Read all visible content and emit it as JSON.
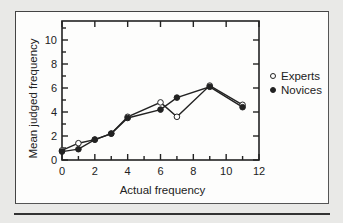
{
  "chart_data": {
    "type": "line",
    "title": "",
    "xlabel": "Actual frequency",
    "ylabel": "Mean judged frequency",
    "xlim": [
      0,
      12
    ],
    "ylim": [
      0,
      11
    ],
    "xticks": [
      0,
      2,
      4,
      6,
      8,
      10,
      12
    ],
    "yticks": [
      0,
      2,
      4,
      6,
      8,
      10
    ],
    "grid": false,
    "legend_position": "right",
    "series": [
      {
        "name": "Experts",
        "marker": "open-circle",
        "x": [
          0,
          1,
          2,
          3,
          4,
          6,
          7,
          9,
          11
        ],
        "y": [
          0.8,
          1.4,
          1.7,
          2.2,
          3.6,
          4.8,
          3.6,
          6.2,
          4.6
        ]
      },
      {
        "name": "Novices",
        "marker": "filled-circle",
        "x": [
          0,
          1,
          2,
          3,
          4,
          6,
          7,
          9,
          11
        ],
        "y": [
          0.7,
          0.9,
          1.7,
          2.2,
          3.5,
          4.2,
          5.2,
          6.1,
          4.4
        ]
      }
    ]
  },
  "colors": {
    "background": "#e9e9e7",
    "panel": "#fdfdfc",
    "ink": "#222222"
  }
}
